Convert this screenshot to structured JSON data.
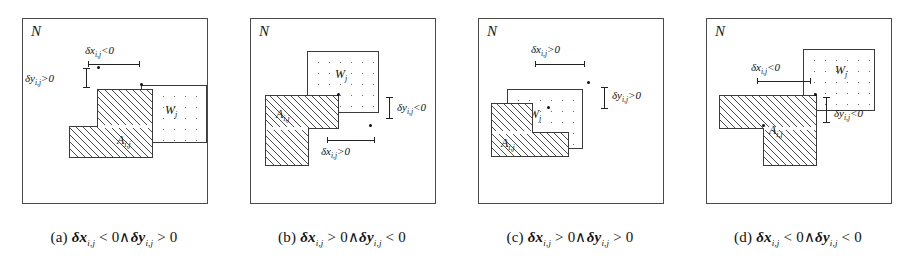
{
  "figure": {
    "panel_count": 4,
    "outer_region_label": "N",
    "hatched_region_label": "A",
    "hatched_region_sub": "i,j",
    "dotted_region_label": "W",
    "dotted_region_sub": "j",
    "delta_x_symbol": "δx",
    "delta_y_symbol": "δy",
    "subscript": "i,j"
  },
  "panels": [
    {
      "id": "a",
      "frame_label": "N",
      "dx_label": "δx",
      "dx_sub": "i,j",
      "dx_relation": "<0",
      "dy_label": "δy",
      "dy_sub": "i,j",
      "dy_relation": ">0",
      "shape_a_label": "A",
      "shape_a_sub": "i,j",
      "shape_w_label": "W",
      "shape_w_sub": "j",
      "caption_index": "(a)",
      "caption_dx": "δx",
      "caption_dx_sub": "i,j",
      "caption_dx_rel": "< 0",
      "caption_conj": "∧",
      "caption_dy": "δy",
      "caption_dy_sub": "i,j",
      "caption_dy_rel": "> 0"
    },
    {
      "id": "b",
      "frame_label": "N",
      "dx_label": "δx",
      "dx_sub": "i,j",
      "dx_relation": ">0",
      "dy_label": "δy",
      "dy_sub": "i,j",
      "dy_relation": "<0",
      "shape_a_label": "A",
      "shape_a_sub": "i,j",
      "shape_w_label": "W",
      "shape_w_sub": "j",
      "caption_index": "(b)",
      "caption_dx": "δx",
      "caption_dx_sub": "i,j",
      "caption_dx_rel": "> 0",
      "caption_conj": "∧",
      "caption_dy": "δy",
      "caption_dy_sub": "i,j",
      "caption_dy_rel": "< 0"
    },
    {
      "id": "c",
      "frame_label": "N",
      "dx_label": "δx",
      "dx_sub": "i,j",
      "dx_relation": ">0",
      "dy_label": "δy",
      "dy_sub": "i,j",
      "dy_relation": ">0",
      "shape_a_label": "A",
      "shape_a_sub": "i,j",
      "shape_w_label": "W",
      "shape_w_sub": "j",
      "caption_index": "(c)",
      "caption_dx": "δx",
      "caption_dx_sub": "i,j",
      "caption_dx_rel": "> 0",
      "caption_conj": "∧",
      "caption_dy": "δy",
      "caption_dy_sub": "i,j",
      "caption_dy_rel": "> 0"
    },
    {
      "id": "d",
      "frame_label": "N",
      "dx_label": "δx",
      "dx_sub": "i,j",
      "dx_relation": "<0",
      "dy_label": "δy",
      "dy_sub": "i,j",
      "dy_relation": "<0",
      "shape_a_label": "A",
      "shape_a_sub": "i,j",
      "shape_w_label": "W",
      "shape_w_sub": "j",
      "caption_index": "(d)",
      "caption_dx": "δx",
      "caption_dx_sub": "i,j",
      "caption_dx_rel": "< 0",
      "caption_conj": "∧",
      "caption_dy": "δy",
      "caption_dy_sub": "i,j",
      "caption_dy_rel": "< 0"
    }
  ],
  "colors": {
    "frame_stroke": "#4a4a4a",
    "shape_stroke": "#3a3a3a",
    "hatch_line": "#4a4a4a",
    "dot_fill": "#6a6a6a",
    "text": "#111111",
    "background": "#ffffff"
  }
}
